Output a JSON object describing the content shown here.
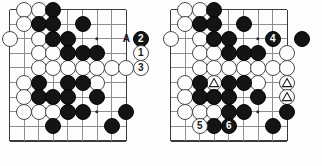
{
  "figure": {
    "type": "go-board-diagram",
    "panel_count": 2,
    "board_grid": {
      "cols": 9,
      "rows": 10,
      "spacing_px": 14.6
    },
    "colors": {
      "black_stone": "#141414",
      "white_stone": "#fdfdfd",
      "grid_line": "#8e8e8e",
      "board_edge": "#3a3a3a",
      "background": "#fdfdfd"
    }
  },
  "panels": [
    {
      "name": "left-diagram",
      "title": "",
      "black_stones": [
        {
          "col": 3,
          "row": 0
        },
        {
          "col": 2,
          "row": 1
        },
        {
          "col": 3,
          "row": 1
        },
        {
          "col": 5,
          "row": 1
        },
        {
          "col": 3,
          "row": 2
        },
        {
          "col": 4,
          "row": 2
        },
        {
          "col": 4,
          "row": 3
        },
        {
          "col": 5,
          "row": 3
        },
        {
          "col": 6,
          "row": 3
        },
        {
          "col": 2,
          "row": 5
        },
        {
          "col": 4,
          "row": 5
        },
        {
          "col": 5,
          "row": 5
        },
        {
          "col": 2,
          "row": 6
        },
        {
          "col": 3,
          "row": 6
        },
        {
          "col": 4,
          "row": 6
        },
        {
          "col": 6,
          "row": 6
        },
        {
          "col": 4,
          "row": 7
        },
        {
          "col": 5,
          "row": 7
        },
        {
          "col": 8,
          "row": 7
        },
        {
          "col": 3,
          "row": 8
        },
        {
          "col": 7,
          "row": 8
        }
      ],
      "white_stones": [
        {
          "col": 1,
          "row": 0
        },
        {
          "col": 2,
          "row": 0
        },
        {
          "col": 1,
          "row": 1
        },
        {
          "col": 0,
          "row": 2
        },
        {
          "col": 2,
          "row": 2
        },
        {
          "col": 2,
          "row": 3
        },
        {
          "col": 3,
          "row": 3
        },
        {
          "col": 2,
          "row": 4
        },
        {
          "col": 3,
          "row": 4
        },
        {
          "col": 4,
          "row": 4
        },
        {
          "col": 5,
          "row": 4
        },
        {
          "col": 6,
          "row": 4
        },
        {
          "col": 7,
          "row": 4
        },
        {
          "col": 8,
          "row": 4
        },
        {
          "col": 1,
          "row": 5
        },
        {
          "col": 6,
          "row": 5
        },
        {
          "col": 1,
          "row": 6
        },
        {
          "col": 1,
          "row": 7
        },
        {
          "col": 2,
          "row": 7
        },
        {
          "col": 3,
          "row": 7
        }
      ],
      "numbered_stones": [
        {
          "label": "2",
          "color": "black",
          "col": 9,
          "row": 2
        },
        {
          "label": "1",
          "color": "white",
          "col": 9,
          "row": 3
        },
        {
          "label": "3",
          "color": "white",
          "col": 9,
          "row": 4
        }
      ],
      "point_labels": [
        {
          "text": "A",
          "col": 8,
          "row": 2
        }
      ],
      "triangle_markers": []
    },
    {
      "name": "right-diagram",
      "title": "",
      "black_stones": [
        {
          "col": 3,
          "row": 0
        },
        {
          "col": 2,
          "row": 1
        },
        {
          "col": 3,
          "row": 1
        },
        {
          "col": 5,
          "row": 1
        },
        {
          "col": 3,
          "row": 2
        },
        {
          "col": 4,
          "row": 2
        },
        {
          "col": 9,
          "row": 2
        },
        {
          "col": 4,
          "row": 3
        },
        {
          "col": 5,
          "row": 3
        },
        {
          "col": 6,
          "row": 3
        },
        {
          "col": 2,
          "row": 5
        },
        {
          "col": 4,
          "row": 5
        },
        {
          "col": 5,
          "row": 5
        },
        {
          "col": 2,
          "row": 6
        },
        {
          "col": 3,
          "row": 6
        },
        {
          "col": 4,
          "row": 6
        },
        {
          "col": 6,
          "row": 6
        },
        {
          "col": 4,
          "row": 7
        },
        {
          "col": 5,
          "row": 7
        },
        {
          "col": 8,
          "row": 7
        },
        {
          "col": 3,
          "row": 8
        },
        {
          "col": 7,
          "row": 8
        }
      ],
      "white_stones": [
        {
          "col": 1,
          "row": 0
        },
        {
          "col": 2,
          "row": 0
        },
        {
          "col": 1,
          "row": 1
        },
        {
          "col": 0,
          "row": 2
        },
        {
          "col": 2,
          "row": 2
        },
        {
          "col": 2,
          "row": 3
        },
        {
          "col": 3,
          "row": 3
        },
        {
          "col": 8,
          "row": 3
        },
        {
          "col": 2,
          "row": 4
        },
        {
          "col": 3,
          "row": 4
        },
        {
          "col": 4,
          "row": 4
        },
        {
          "col": 5,
          "row": 4
        },
        {
          "col": 6,
          "row": 4
        },
        {
          "col": 7,
          "row": 4
        },
        {
          "col": 8,
          "row": 4
        },
        {
          "col": 1,
          "row": 5
        },
        {
          "col": 3,
          "row": 5
        },
        {
          "col": 6,
          "row": 5
        },
        {
          "col": 8,
          "row": 5
        },
        {
          "col": 1,
          "row": 6
        },
        {
          "col": 8,
          "row": 6
        },
        {
          "col": 1,
          "row": 7
        },
        {
          "col": 2,
          "row": 7
        },
        {
          "col": 3,
          "row": 7
        }
      ],
      "numbered_stones": [
        {
          "label": "4",
          "color": "black",
          "col": 7,
          "row": 2
        },
        {
          "label": "5",
          "color": "white",
          "col": 2,
          "row": 8
        },
        {
          "label": "6",
          "color": "black",
          "col": 4,
          "row": 8
        }
      ],
      "point_labels": [],
      "triangle_markers": [
        {
          "col": 3,
          "row": 5
        },
        {
          "col": 8,
          "row": 5
        },
        {
          "col": 8,
          "row": 6
        }
      ]
    }
  ]
}
